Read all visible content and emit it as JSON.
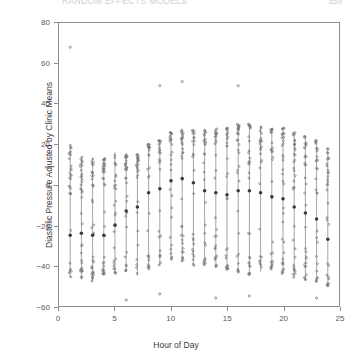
{
  "page_header": {
    "title": "RANDOM EFFECTS MODELS",
    "page_number": "359"
  },
  "chart_data": {
    "type": "scatter",
    "title": "",
    "xlabel": "Hour of Day",
    "ylabel": "Diastolic Pressure Adjusted by Clinic Means",
    "xlim": [
      0,
      25
    ],
    "ylim": [
      -60,
      80
    ],
    "xticks": [
      0,
      5,
      10,
      15,
      20,
      25
    ],
    "yticks": [
      -60,
      -40,
      -20,
      0,
      20,
      40,
      60,
      80
    ],
    "grid": false,
    "legend": null,
    "marker": "open-circle",
    "mean_marker": "filled-circle",
    "x": [
      1,
      2,
      3,
      4,
      5,
      6,
      7,
      8,
      9,
      10,
      11,
      12,
      13,
      14,
      15,
      16,
      17,
      18,
      19,
      20,
      21,
      22,
      23,
      24
    ],
    "series": [
      {
        "name": "Hourly mean",
        "values": [
          -25,
          -24,
          -25,
          -25,
          -20,
          -13,
          -11,
          -4,
          -2,
          2,
          3,
          1,
          -3,
          -4,
          -5,
          -3,
          -3,
          -4,
          -6,
          -7,
          -11,
          -14,
          -17,
          -27
        ]
      },
      {
        "name": "Range low",
        "values": [
          -46,
          -47,
          -48,
          -45,
          -44,
          -43,
          -45,
          -42,
          -40,
          -37,
          -38,
          -40,
          -40,
          -41,
          -42,
          -44,
          -45,
          -43,
          -42,
          -44,
          -46,
          -47,
          -48,
          -50
        ]
      },
      {
        "name": "Range high",
        "values": [
          20,
          14,
          13,
          13,
          16,
          15,
          15,
          20,
          22,
          26,
          27,
          27,
          27,
          28,
          28,
          30,
          30,
          29,
          28,
          28,
          26,
          24,
          22,
          18
        ]
      }
    ],
    "outliers": [
      {
        "x": 1,
        "y": 68
      },
      {
        "x": 9,
        "y": 49
      },
      {
        "x": 11,
        "y": 51
      },
      {
        "x": 16,
        "y": 49
      },
      {
        "x": 6,
        "y": -57
      },
      {
        "x": 9,
        "y": -54
      },
      {
        "x": 14,
        "y": -56
      },
      {
        "x": 17,
        "y": -55
      },
      {
        "x": 23,
        "y": -56
      }
    ]
  }
}
